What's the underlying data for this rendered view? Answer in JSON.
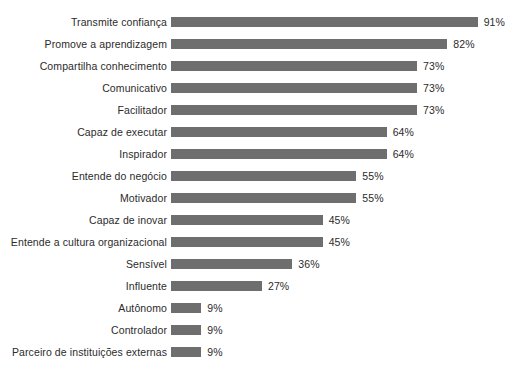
{
  "chart_data": {
    "type": "bar",
    "orientation": "horizontal",
    "title": "",
    "subtitle": "",
    "xlabel": "",
    "ylabel": "",
    "grid": false,
    "legend": false,
    "xlim": [
      0,
      100
    ],
    "value_suffix": "%",
    "bar_color": "#6e6e6e",
    "background_color": "#ffffff",
    "text_color": "#2b2b2b",
    "categories": [
      "Transmite confiança",
      "Promove a aprendizagem",
      "Compartilha conhecimento",
      "Comunicativo",
      "Facilitador",
      "Capaz de executar",
      "Inspirador",
      "Entende do negócio",
      "Motivador",
      "Capaz de inovar",
      "Entende a cultura organizacional",
      "Sensível",
      "Influente",
      "Autônomo",
      "Controlador",
      "Parceiro de instituições externas"
    ],
    "values": [
      91,
      82,
      73,
      73,
      73,
      64,
      64,
      55,
      55,
      45,
      45,
      36,
      27,
      9,
      9,
      9
    ],
    "value_labels": [
      "91%",
      "82%",
      "73%",
      "73%",
      "73%",
      "64%",
      "64%",
      "55%",
      "55%",
      "45%",
      "45%",
      "36%",
      "27%",
      "9%",
      "9%",
      "9%"
    ]
  }
}
